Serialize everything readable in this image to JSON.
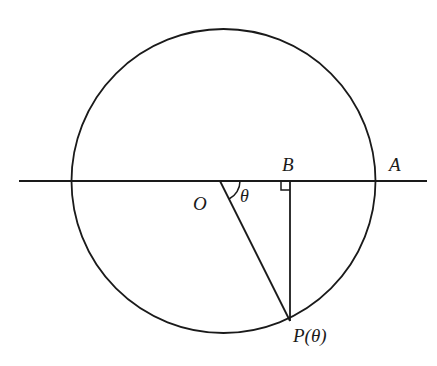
{
  "diagram": {
    "type": "geometry",
    "stroke_color": "#1a1a1a",
    "background": "#ffffff",
    "circle": {
      "cx": 223.5,
      "cy": 181,
      "r": 152
    },
    "axis_line": {
      "x1": 19,
      "y1": 181,
      "x2": 427,
      "y2": 181
    },
    "points": {
      "O": {
        "x": 220,
        "y": 181
      },
      "A": {
        "x": 375,
        "y": 181
      },
      "B": {
        "x": 290,
        "y": 181
      },
      "P": {
        "x": 290,
        "y": 321
      }
    },
    "labels": {
      "O": "O",
      "A": "A",
      "B": "B",
      "P": "P(θ)",
      "theta": "θ"
    }
  }
}
